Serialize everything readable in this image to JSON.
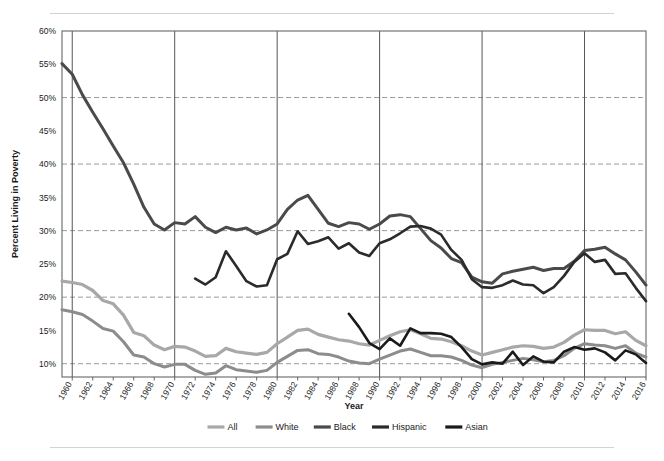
{
  "chart_data": {
    "type": "line",
    "title": "",
    "xlabel": "Year",
    "ylabel": "Percent Living in Poverty",
    "xlim": [
      1959,
      2016
    ],
    "ylim": [
      8,
      60
    ],
    "yticks": [
      "10%",
      "15%",
      "20%",
      "25%",
      "30%",
      "35%",
      "40%",
      "45%",
      "50%",
      "55%",
      "60%"
    ],
    "ytick_values": [
      10,
      15,
      20,
      25,
      30,
      35,
      40,
      45,
      50,
      55,
      60
    ],
    "grid": "horizontal-dashed-at-10-20-30-40-50; vertical-solid-at-decades",
    "vertical_gridline_years": [
      1960,
      1970,
      1980,
      1990,
      2000,
      2010
    ],
    "legend_position": "bottom",
    "xtick_labels": [
      "1960",
      "1962",
      "1964",
      "1966",
      "1968",
      "1970",
      "1972",
      "1974",
      "1976",
      "1978",
      "1980",
      "1982",
      "1984",
      "1986",
      "1988",
      "1990",
      "1992",
      "1994",
      "1996",
      "1998",
      "2000",
      "2002",
      "2004",
      "2006",
      "2008",
      "2010",
      "2012",
      "2014",
      "2016"
    ],
    "xtick_values": [
      1960,
      1962,
      1964,
      1966,
      1968,
      1970,
      1972,
      1974,
      1976,
      1978,
      1980,
      1982,
      1984,
      1986,
      1988,
      1990,
      1992,
      1994,
      1996,
      1998,
      2000,
      2002,
      2004,
      2006,
      2008,
      2010,
      2012,
      2014,
      2016
    ],
    "series": [
      {
        "name": "All",
        "color": "#a8a8a8",
        "width": 3.2,
        "x": [
          1959,
          1960,
          1961,
          1962,
          1963,
          1964,
          1965,
          1966,
          1967,
          1968,
          1969,
          1970,
          1971,
          1972,
          1973,
          1974,
          1975,
          1976,
          1977,
          1978,
          1979,
          1980,
          1981,
          1982,
          1983,
          1984,
          1985,
          1986,
          1987,
          1988,
          1989,
          1990,
          1991,
          1992,
          1993,
          1994,
          1995,
          1996,
          1997,
          1998,
          1999,
          2000,
          2001,
          2002,
          2003,
          2004,
          2005,
          2006,
          2007,
          2008,
          2009,
          2010,
          2011,
          2012,
          2013,
          2014,
          2015,
          2016
        ],
        "values": [
          22.4,
          22.2,
          21.9,
          21.0,
          19.5,
          19.0,
          17.3,
          14.7,
          14.2,
          12.8,
          12.1,
          12.6,
          12.5,
          11.9,
          11.1,
          11.2,
          12.3,
          11.8,
          11.6,
          11.4,
          11.7,
          13.0,
          14.0,
          15.0,
          15.2,
          14.4,
          14.0,
          13.6,
          13.4,
          13.0,
          12.8,
          13.5,
          14.2,
          14.8,
          15.1,
          14.5,
          13.8,
          13.7,
          13.3,
          12.7,
          11.9,
          11.3,
          11.7,
          12.1,
          12.5,
          12.7,
          12.6,
          12.3,
          12.5,
          13.2,
          14.3,
          15.1,
          15.0,
          15.0,
          14.5,
          14.8,
          13.5,
          12.7
        ]
      },
      {
        "name": "White",
        "color": "#8c8c8c",
        "width": 3.0,
        "x": [
          1959,
          1960,
          1961,
          1962,
          1963,
          1964,
          1965,
          1966,
          1967,
          1968,
          1969,
          1970,
          1971,
          1972,
          1973,
          1974,
          1975,
          1976,
          1977,
          1978,
          1979,
          1980,
          1981,
          1982,
          1983,
          1984,
          1985,
          1986,
          1987,
          1988,
          1989,
          1990,
          1991,
          1992,
          1993,
          1994,
          1995,
          1996,
          1997,
          1998,
          1999,
          2000,
          2001,
          2002,
          2003,
          2004,
          2005,
          2006,
          2007,
          2008,
          2009,
          2010,
          2011,
          2012,
          2013,
          2014,
          2015,
          2016
        ],
        "values": [
          18.1,
          17.8,
          17.4,
          16.4,
          15.3,
          14.9,
          13.3,
          11.3,
          11.0,
          10.0,
          9.5,
          9.9,
          9.9,
          9.0,
          8.4,
          8.6,
          9.7,
          9.1,
          8.9,
          8.7,
          9.0,
          10.2,
          11.1,
          12.0,
          12.1,
          11.5,
          11.4,
          11.0,
          10.4,
          10.1,
          10.0,
          10.7,
          11.3,
          11.9,
          12.2,
          11.7,
          11.2,
          11.2,
          11.0,
          10.5,
          9.8,
          9.4,
          9.9,
          10.2,
          10.5,
          10.8,
          10.6,
          10.3,
          10.5,
          11.2,
          12.3,
          13.0,
          12.8,
          12.7,
          12.3,
          12.7,
          11.6,
          11.0
        ]
      },
      {
        "name": "Black",
        "color": "#4a4a4a",
        "width": 3.0,
        "x": [
          1959,
          1960,
          1961,
          1962,
          1963,
          1964,
          1965,
          1966,
          1967,
          1968,
          1969,
          1970,
          1971,
          1972,
          1973,
          1974,
          1975,
          1976,
          1977,
          1978,
          1979,
          1980,
          1981,
          1982,
          1983,
          1984,
          1985,
          1986,
          1987,
          1988,
          1989,
          1990,
          1991,
          1992,
          1993,
          1994,
          1995,
          1996,
          1997,
          1998,
          1999,
          2000,
          2001,
          2002,
          2003,
          2004,
          2005,
          2006,
          2007,
          2008,
          2009,
          2010,
          2011,
          2012,
          2013,
          2014,
          2015,
          2016
        ],
        "values": [
          55.1,
          53.5,
          50.4,
          47.8,
          45.3,
          42.7,
          40.2,
          37.0,
          33.5,
          31.0,
          30.1,
          31.2,
          31.0,
          32.1,
          30.5,
          29.7,
          30.5,
          30.1,
          30.4,
          29.5,
          30.1,
          31.0,
          33.2,
          34.6,
          35.3,
          33.2,
          31.1,
          30.6,
          31.2,
          31.0,
          30.2,
          31.0,
          32.2,
          32.4,
          32.1,
          30.3,
          28.5,
          27.4,
          25.8,
          25.2,
          23.0,
          22.3,
          22.1,
          23.5,
          23.9,
          24.2,
          24.5,
          24.0,
          24.3,
          24.3,
          25.4,
          27.0,
          27.2,
          27.5,
          26.5,
          25.6,
          23.8,
          21.8
        ]
      },
      {
        "name": "Hispanic",
        "color": "#2b2b2b",
        "width": 2.6,
        "x": [
          1972,
          1973,
          1974,
          1975,
          1976,
          1977,
          1978,
          1979,
          1980,
          1981,
          1982,
          1983,
          1984,
          1985,
          1986,
          1987,
          1988,
          1989,
          1990,
          1991,
          1992,
          1993,
          1994,
          1995,
          1996,
          1997,
          1998,
          1999,
          2000,
          2001,
          2002,
          2003,
          2004,
          2005,
          2006,
          2007,
          2008,
          2009,
          2010,
          2011,
          2012,
          2013,
          2014,
          2015,
          2016
        ],
        "values": [
          22.8,
          21.9,
          23.0,
          26.9,
          24.7,
          22.4,
          21.6,
          21.8,
          25.7,
          26.5,
          29.9,
          28.0,
          28.4,
          29.0,
          27.3,
          28.1,
          26.7,
          26.2,
          28.1,
          28.7,
          29.6,
          30.6,
          30.7,
          30.3,
          29.4,
          27.1,
          25.6,
          22.7,
          21.5,
          21.4,
          21.8,
          22.5,
          21.9,
          21.8,
          20.6,
          21.5,
          23.2,
          25.3,
          26.6,
          25.3,
          25.6,
          23.5,
          23.6,
          21.4,
          19.4
        ]
      },
      {
        "name": "Asian",
        "color": "#1a1a1a",
        "width": 2.6,
        "x": [
          1987,
          1988,
          1989,
          1990,
          1991,
          1992,
          1993,
          1994,
          1995,
          1996,
          1997,
          1998,
          1999,
          2000,
          2001,
          2002,
          2003,
          2004,
          2005,
          2006,
          2007,
          2008,
          2009,
          2010,
          2011,
          2012,
          2013,
          2014,
          2015,
          2016
        ],
        "values": [
          17.5,
          15.5,
          13.1,
          12.2,
          13.8,
          12.7,
          15.3,
          14.6,
          14.6,
          14.5,
          14.0,
          12.5,
          10.7,
          9.9,
          10.2,
          10.0,
          11.8,
          9.8,
          11.1,
          10.3,
          10.2,
          11.8,
          12.5,
          12.1,
          12.3,
          11.7,
          10.5,
          12.0,
          11.4,
          10.1
        ]
      }
    ]
  },
  "legend": {
    "items": [
      {
        "label": "All",
        "color": "#a8a8a8"
      },
      {
        "label": "White",
        "color": "#8c8c8c"
      },
      {
        "label": "Black",
        "color": "#4a4a4a"
      },
      {
        "label": "Hispanic",
        "color": "#2b2b2b"
      },
      {
        "label": "Asian",
        "color": "#1a1a1a"
      }
    ]
  },
  "colors": {
    "axis": "#666666",
    "grid_dashed": "#9a9a9a",
    "grid_vertical": "#555555",
    "rule": "#d2d2d2",
    "text": "#1a1a1a"
  }
}
